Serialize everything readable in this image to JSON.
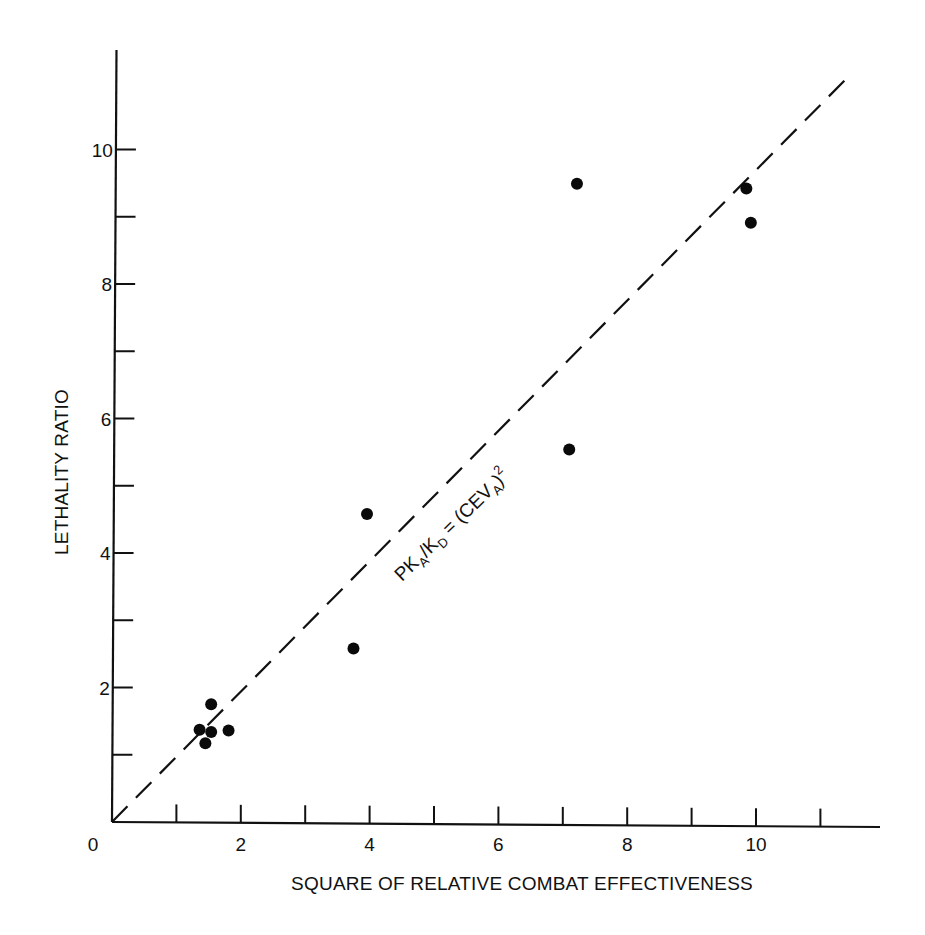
{
  "chart_data": {
    "type": "scatter",
    "title": "",
    "xlabel": "SQUARE OF RELATIVE COMBAT EFFECTIVENESS",
    "ylabel": "LETHALITY RATIO",
    "xlim": [
      0,
      11.8
    ],
    "ylim": [
      0,
      11.5
    ],
    "grid": false,
    "legend": null,
    "x_ticks": [
      1,
      2,
      3,
      4,
      5,
      6,
      7,
      8,
      9,
      10,
      11
    ],
    "x_tick_labels": [
      {
        "value": 0,
        "label": "0"
      },
      {
        "value": 2,
        "label": "2"
      },
      {
        "value": 4,
        "label": "4"
      },
      {
        "value": 6,
        "label": "6"
      },
      {
        "value": 8,
        "label": "8"
      },
      {
        "value": 10,
        "label": "10"
      }
    ],
    "y_ticks": [
      1,
      2,
      3,
      4,
      5,
      6,
      7,
      8,
      9,
      10
    ],
    "y_tick_labels": [
      {
        "value": 2,
        "label": "2"
      },
      {
        "value": 4,
        "label": "4"
      },
      {
        "value": 6,
        "label": "6"
      },
      {
        "value": 8,
        "label": "8"
      },
      {
        "value": 10,
        "label": "10"
      }
    ],
    "series": [
      {
        "name": "observations",
        "marker": "filled-circle",
        "points": [
          {
            "x": 1.36,
            "y": 1.37
          },
          {
            "x": 1.45,
            "y": 1.17
          },
          {
            "x": 1.54,
            "y": 1.34
          },
          {
            "x": 1.54,
            "y": 1.75
          },
          {
            "x": 1.81,
            "y": 1.36
          },
          {
            "x": 3.75,
            "y": 2.58
          },
          {
            "x": 3.96,
            "y": 4.58
          },
          {
            "x": 7.1,
            "y": 5.54
          },
          {
            "x": 7.22,
            "y": 9.49
          },
          {
            "x": 9.85,
            "y": 9.42
          },
          {
            "x": 9.92,
            "y": 8.91
          }
        ]
      },
      {
        "name": "theory",
        "style": "dashed-line",
        "equation": "y = x",
        "points": [
          {
            "x": 0,
            "y": 0
          },
          {
            "x": 11.4,
            "y": 11.05
          }
        ]
      }
    ],
    "annotations": [
      {
        "text_parts": {
          "pk": "PK",
          "a1": "A",
          "slash_k": "/K",
          "d": "D",
          "eq": " = (CEV",
          "a2": "A",
          "close": ")",
          "sq": "2"
        },
        "full_text": "PK_A/K_D = (CEV_A)^2",
        "position": {
          "x": 5.0,
          "y": 5.0
        },
        "rotation": "along dashed line"
      }
    ]
  }
}
